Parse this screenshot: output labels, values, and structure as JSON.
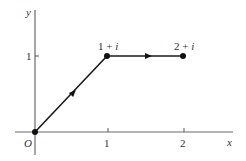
{
  "diagram": {
    "type": "complex-plane-path",
    "axes": {
      "x_label": "x",
      "y_label": "y",
      "origin_label": "O",
      "x_ticks": [
        "1",
        "2"
      ],
      "y_ticks": [
        "1"
      ]
    },
    "points": [
      {
        "name": "origin",
        "label": "O",
        "x": 0,
        "y": 0
      },
      {
        "name": "point-1-plus-i",
        "label_real": "1",
        "label_op": "+",
        "label_imag": "i",
        "x": 1,
        "y": 1
      },
      {
        "name": "point-2-plus-i",
        "label_real": "2",
        "label_op": "+",
        "label_imag": "i",
        "x": 2,
        "y": 1
      }
    ],
    "segments": [
      {
        "from": "O",
        "to": "1+i",
        "direction_arrow": true
      },
      {
        "from": "1+i",
        "to": "2+i",
        "direction_arrow": true
      }
    ],
    "colors": {
      "axis": "#6a6a6a",
      "path": "#1a1a1a",
      "text": "#333333"
    }
  }
}
